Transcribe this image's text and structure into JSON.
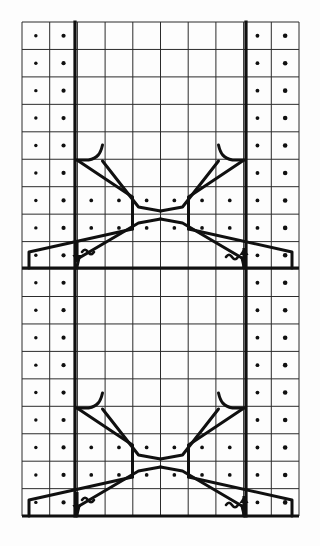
{
  "figure": {
    "background_color": "#fdfdfd",
    "ink_color": "#101010",
    "grid_line_color": "#2b2b2b",
    "grid": {
      "left": 22,
      "top": 22,
      "right": 299,
      "bottom": 516,
      "columns": 10,
      "rows": 18,
      "cell_width": 27.7,
      "cell_height": 27.45,
      "thin_line_width": 1.0,
      "heavy_line_width": 3.2
    },
    "dotted_cells": {
      "note": "dot at the center of each marked cell",
      "dot_radius": 2.1,
      "margin_columns": [
        0,
        1,
        8,
        9
      ],
      "margin_column_rows": [
        0,
        1,
        2,
        3,
        4,
        5,
        6,
        7,
        8,
        9,
        10,
        11,
        12,
        13,
        14,
        15,
        16,
        17
      ],
      "interior_dot_cells": [
        [
          2,
          6
        ],
        [
          3,
          6
        ],
        [
          4,
          6
        ],
        [
          5,
          6
        ],
        [
          6,
          6
        ],
        [
          7,
          6
        ],
        [
          2,
          7
        ],
        [
          3,
          7
        ],
        [
          4,
          7
        ],
        [
          5,
          7
        ],
        [
          6,
          7
        ],
        [
          7,
          7
        ],
        [
          2,
          15
        ],
        [
          3,
          15
        ],
        [
          4,
          15
        ],
        [
          5,
          15
        ],
        [
          6,
          15
        ],
        [
          7,
          15
        ],
        [
          2,
          16
        ],
        [
          3,
          16
        ],
        [
          4,
          16
        ],
        [
          5,
          16
        ],
        [
          6,
          16
        ],
        [
          7,
          16
        ]
      ]
    },
    "heavy_lines": {
      "left_vertical_x": 75,
      "right_vertical_x": 246,
      "midline_y": 268,
      "bottom_rule_y": 516
    },
    "bowties": [
      {
        "name": "upper-bowtie",
        "waist_y": 213,
        "top_y": 158,
        "bottom_y": 268,
        "waist_half_width": 22,
        "mouth_half_width": 86
      },
      {
        "name": "lower-bowtie",
        "waist_y": 461,
        "top_y": 406,
        "bottom_y": 516,
        "waist_half_width": 22,
        "mouth_half_width": 86
      }
    ],
    "annotations": [
      {
        "name": "upper-left-marker",
        "glyph": "arrow-down",
        "x": 77,
        "y": 262
      },
      {
        "name": "upper-left-wave",
        "glyph": "wave",
        "x": 88,
        "y": 252
      },
      {
        "name": "upper-right-marker",
        "glyph": "arrow-up",
        "x": 244,
        "y": 248
      },
      {
        "name": "upper-right-wave",
        "glyph": "wave",
        "x": 232,
        "y": 257
      },
      {
        "name": "lower-left-marker",
        "glyph": "arrow-down",
        "x": 77,
        "y": 512
      },
      {
        "name": "lower-left-wave",
        "glyph": "wave",
        "x": 88,
        "y": 500
      },
      {
        "name": "lower-right-marker",
        "glyph": "arrow-up",
        "x": 244,
        "y": 496
      },
      {
        "name": "lower-right-wave",
        "glyph": "wave",
        "x": 232,
        "y": 505
      }
    ]
  }
}
